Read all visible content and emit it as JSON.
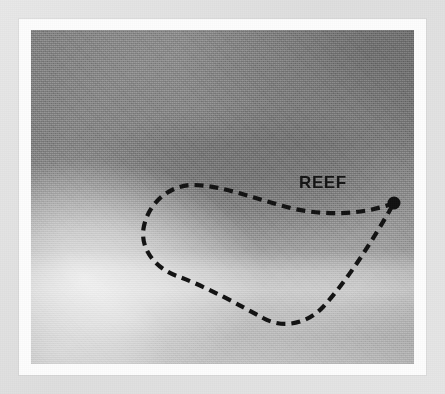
{
  "figure": {
    "kind": "annotated-grayscale-photograph",
    "frame_color": "#fdfdfd",
    "mount_color": "#e2e2e2"
  },
  "photo": {
    "description": "Grayscale aerial / side-scan style plate of a shallow seabed",
    "base_tone": "#9d9d9d",
    "dark_tone": "#808080",
    "mid_tone": "#a8a8a8",
    "bright_tone": "#d8d8d8"
  },
  "annotation": {
    "label": "REEF",
    "label_color": "#141414",
    "outline_color": "#121212",
    "outline_style": "dashed",
    "marker_color": "#101010",
    "label_position": {
      "x": 268,
      "y": 158
    },
    "marker_position": {
      "x": 363,
      "y": 173
    },
    "marker_radius": 6.5,
    "outline_path": "M 363 173 C 330 186, 286 186, 252 176 C 222 168, 192 156, 164 155 C 140 154, 118 172, 113 196 C 108 218, 124 238, 146 246 C 176 257, 210 276, 232 288 C 252 299, 276 294, 292 277 C 316 251, 342 210, 363 173"
  }
}
